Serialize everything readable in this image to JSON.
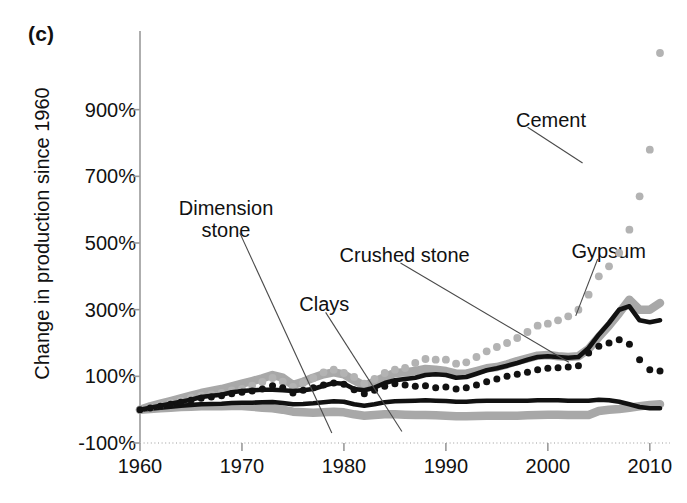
{
  "figure": {
    "panel_label": "(c)",
    "ylabel": "Change in production since 1960"
  },
  "axes": {
    "y_ticks": [
      "900%",
      "700%",
      "500%",
      "300%",
      "100%",
      "-100%"
    ],
    "y_tick_values": [
      900,
      700,
      500,
      300,
      100,
      -100
    ],
    "x_ticks": [
      "1960",
      "1970",
      "1980",
      "1990",
      "2000",
      "2010"
    ],
    "x_tick_values": [
      1960,
      1970,
      1980,
      1990,
      2000,
      2010
    ]
  },
  "annotations": [
    {
      "name": "cement",
      "label": "Cement",
      "x_pct": 80.2,
      "y_pct": 21.6,
      "leader": {
        "x1": 76.8,
        "y1": 25.3,
        "x2": 84.8,
        "y2": 32.4
      }
    },
    {
      "name": "gypsum",
      "label": "Gypsum",
      "x_pct": 88.6,
      "y_pct": 47.8,
      "leader": {
        "x1": 87.0,
        "y1": 51.5,
        "x2": 83.8,
        "y2": 62.8
      }
    },
    {
      "name": "crushed-stone",
      "label": "Crushed stone",
      "x_pct": 58.9,
      "y_pct": 48.6,
      "leader": {
        "x1": 58.3,
        "y1": 52.3,
        "x2": 82.8,
        "y2": 72.0
      }
    },
    {
      "name": "clays",
      "label": "Clays",
      "x_pct": 47.2,
      "y_pct": 58.3,
      "leader": {
        "x1": 47.4,
        "y1": 62.1,
        "x2": 58.5,
        "y2": 85.8
      }
    },
    {
      "name": "dimension-stone",
      "label": "Dimension\nstone",
      "x_pct": 32.9,
      "y_pct": 39.1,
      "leader": {
        "x1": 34.9,
        "y1": 46.3,
        "x2": 48.3,
        "y2": 86.1
      }
    }
  ],
  "chart_data": {
    "type": "line",
    "title": "",
    "xlabel": "",
    "ylabel": "Change in production since 1960",
    "xlim": [
      1960,
      2011
    ],
    "ylim": [
      -100,
      1100
    ],
    "grid": false,
    "legend": "inline-annotations",
    "x": [
      1960,
      1961,
      1962,
      1963,
      1964,
      1965,
      1966,
      1967,
      1968,
      1969,
      1970,
      1971,
      1972,
      1973,
      1974,
      1975,
      1976,
      1977,
      1978,
      1979,
      1980,
      1981,
      1982,
      1983,
      1984,
      1985,
      1986,
      1987,
      1988,
      1989,
      1990,
      1991,
      1992,
      1993,
      1994,
      1995,
      1996,
      1997,
      1998,
      1999,
      2000,
      2001,
      2002,
      2003,
      2004,
      2005,
      2006,
      2007,
      2008,
      2009,
      2010,
      2011
    ],
    "series": [
      {
        "name": "Cement",
        "style": "dotted",
        "color": "#b3b3b3",
        "values": [
          0,
          6,
          13,
          20,
          27,
          36,
          42,
          46,
          50,
          58,
          62,
          72,
          83,
          95,
          84,
          68,
          80,
          95,
          112,
          120,
          110,
          98,
          78,
          92,
          110,
          120,
          125,
          140,
          152,
          150,
          150,
          138,
          142,
          158,
          175,
          188,
          200,
          215,
          233,
          252,
          258,
          268,
          280,
          300,
          345,
          400,
          430,
          470,
          540,
          640,
          780,
          1070
        ]
      },
      {
        "name": "Crushed stone",
        "style": "solid",
        "color": "#111111",
        "values": [
          0,
          6,
          12,
          18,
          24,
          30,
          38,
          42,
          45,
          52,
          56,
          58,
          60,
          60,
          58,
          56,
          58,
          62,
          72,
          80,
          78,
          62,
          58,
          66,
          80,
          88,
          92,
          96,
          104,
          106,
          104,
          96,
          98,
          108,
          118,
          124,
          132,
          140,
          150,
          158,
          160,
          158,
          156,
          158,
          185,
          225,
          260,
          300,
          310,
          268,
          262,
          268
        ]
      },
      {
        "name": "Gypsum",
        "style": "band",
        "color": "#a8a8a8",
        "values": [
          0,
          10,
          18,
          26,
          34,
          42,
          50,
          56,
          62,
          70,
          78,
          86,
          94,
          104,
          96,
          74,
          84,
          96,
          106,
          112,
          106,
          88,
          72,
          84,
          98,
          110,
          112,
          116,
          122,
          120,
          116,
          108,
          108,
          116,
          124,
          128,
          136,
          146,
          154,
          162,
          164,
          160,
          158,
          160,
          182,
          218,
          252,
          290,
          330,
          300,
          300,
          320
        ]
      },
      {
        "name": "Clays",
        "style": "dotted",
        "color": "#111111",
        "values": [
          0,
          5,
          10,
          16,
          22,
          28,
          34,
          38,
          42,
          48,
          52,
          56,
          62,
          72,
          66,
          50,
          58,
          66,
          74,
          80,
          76,
          60,
          48,
          58,
          70,
          78,
          74,
          70,
          72,
          66,
          68,
          62,
          66,
          74,
          84,
          92,
          100,
          106,
          112,
          120,
          124,
          126,
          128,
          132,
          170,
          190,
          200,
          210,
          196,
          150,
          120,
          116
        ]
      },
      {
        "name": "Dimension stone",
        "style": "solid",
        "color": "#111111",
        "values": [
          0,
          3,
          6,
          9,
          12,
          14,
          16,
          17,
          18,
          20,
          21,
          21,
          22,
          23,
          20,
          16,
          17,
          19,
          22,
          25,
          24,
          16,
          12,
          16,
          22,
          25,
          26,
          27,
          28,
          27,
          26,
          24,
          24,
          26,
          27,
          27,
          27,
          27,
          27,
          28,
          28,
          28,
          27,
          27,
          27,
          30,
          28,
          24,
          16,
          8,
          4,
          4
        ]
      },
      {
        "name": "Dimension stone band",
        "style": "band",
        "color": "#a8a8a8",
        "values": [
          0,
          2,
          4,
          6,
          8,
          9,
          10,
          10,
          10,
          11,
          11,
          9,
          6,
          4,
          0,
          -6,
          -8,
          -9,
          -8,
          -6,
          -8,
          -14,
          -18,
          -16,
          -14,
          -14,
          -15,
          -16,
          -16,
          -17,
          -18,
          -20,
          -20,
          -19,
          -18,
          -18,
          -18,
          -18,
          -17,
          -16,
          -15,
          -15,
          -16,
          -16,
          -16,
          -4,
          0,
          2,
          6,
          10,
          14,
          16
        ]
      }
    ]
  }
}
